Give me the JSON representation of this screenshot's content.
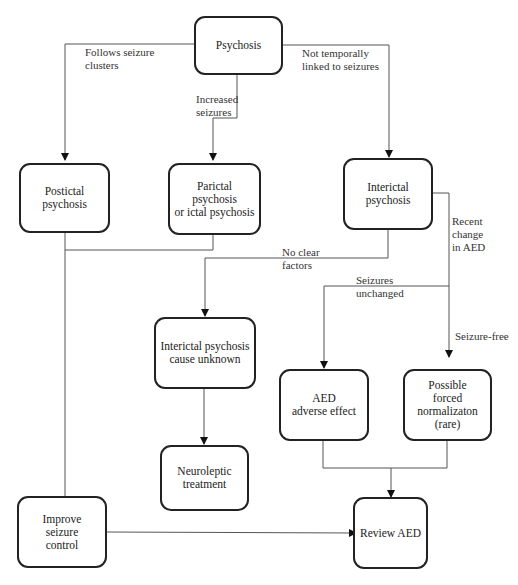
{
  "diagram": {
    "type": "flowchart",
    "nodes": {
      "psychosis": "Psychosis",
      "postictal": "Postictal\npsychosis",
      "parictal": "Parictal psychosis\nor ictal psychosis",
      "interictal": "Interictal\npsychosis",
      "unknown": "Interictal psychosis\ncause unknown",
      "neuroleptic": "Neuroleptic\ntreatment",
      "aed_adverse": "AED\nadverse effect",
      "forced_norm": "Possible\nforced\nnormalizaton\n(rare)",
      "improve": "Improve\nseizure\ncontrol",
      "review": "Review AED"
    },
    "edge_labels": {
      "follows_clusters": "Follows seizure\nclusters",
      "increased_seizures": "Increased\nseizures",
      "not_linked": "Not  temporally\nlinked  to seizures",
      "no_clear": "No clear\nfactors",
      "recent_change": "Recent\nchange\nin AED",
      "seizures_unchanged": "Seizures\nunchanged",
      "seizure_free": "Seizure-free"
    },
    "edges": [
      {
        "from": "psychosis",
        "to": "postictal",
        "label": "follows_clusters"
      },
      {
        "from": "psychosis",
        "to": "parictal",
        "label": "increased_seizures"
      },
      {
        "from": "psychosis",
        "to": "interictal",
        "label": "not_linked"
      },
      {
        "from": "postictal",
        "to": "improve"
      },
      {
        "from": "parictal",
        "to": "improve"
      },
      {
        "from": "interictal",
        "to": "unknown",
        "label": "no_clear"
      },
      {
        "from": "interictal",
        "to": "aed_adverse",
        "label": "recent_change / seizures_unchanged"
      },
      {
        "from": "interictal",
        "to": "forced_norm",
        "label": "recent_change / seizure_free"
      },
      {
        "from": "unknown",
        "to": "neuroleptic"
      },
      {
        "from": "aed_adverse",
        "to": "review"
      },
      {
        "from": "forced_norm",
        "to": "review"
      },
      {
        "from": "improve",
        "to": "review"
      }
    ]
  }
}
